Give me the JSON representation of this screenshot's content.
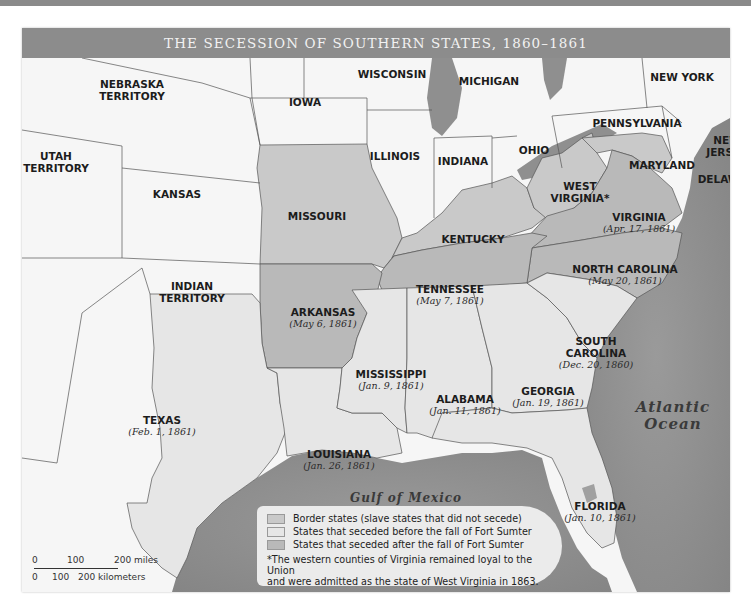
{
  "title": "THE SECESSION OF SOUTHERN STATES, 1860–1861",
  "colors": {
    "union": "#f7f7f7",
    "territory": "#fbfbfb",
    "border_states": "#c9c9c9",
    "seceded_before": "#e6e6e6",
    "seceded_after": "#b9b9b9",
    "water": "#8f8f8f",
    "title_bar": "#8c8c8c"
  },
  "regions": {
    "nebraska": {
      "name": "NEBRASKA",
      "name2": "TERRITORY"
    },
    "utah": {
      "name": "UTAH",
      "name2": "TERRITORY"
    },
    "kansas": {
      "name": "KANSAS"
    },
    "indian": {
      "name": "INDIAN",
      "name2": "TERRITORY"
    },
    "iowa": {
      "name": "IOWA"
    },
    "wisconsin": {
      "name": "WISCONSIN"
    },
    "michigan": {
      "name": "MICHIGAN"
    },
    "illinois": {
      "name": "ILLINOIS"
    },
    "indiana": {
      "name": "INDIANA"
    },
    "ohio": {
      "name": "OHIO"
    },
    "new_york": {
      "name": "NEW YORK"
    },
    "pennsylvania": {
      "name": "PENNSYLVANIA"
    },
    "new_jersey": {
      "name": "NEW",
      "name2": "JERSEY"
    },
    "maryland": {
      "name": "MARYLAND"
    },
    "delaware": {
      "name": "DELAWARE"
    },
    "missouri": {
      "name": "MISSOURI"
    },
    "kentucky": {
      "name": "KENTUCKY"
    },
    "west_virginia": {
      "name": "WEST",
      "name2": "VIRGINIA*"
    },
    "virginia": {
      "name": "VIRGINIA",
      "date": "(Apr. 17, 1861)"
    },
    "north_carolina": {
      "name": "NORTH CAROLINA",
      "date": "(May 20, 1861)"
    },
    "tennessee": {
      "name": "TENNESSEE",
      "date": "(May 7, 1861)"
    },
    "arkansas": {
      "name": "ARKANSAS",
      "date": "(May 6, 1861)"
    },
    "south_carolina": {
      "name": "SOUTH",
      "name2": "CAROLINA",
      "date": "(Dec. 20, 1860)"
    },
    "mississippi": {
      "name": "MISSISSIPPI",
      "date": "(Jan. 9, 1861)"
    },
    "alabama": {
      "name": "ALABAMA",
      "date": "(Jan. 11, 1861)"
    },
    "georgia": {
      "name": "GEORGIA",
      "date": "(Jan. 19, 1861)"
    },
    "texas": {
      "name": "TEXAS",
      "date": "(Feb. 1, 1861)"
    },
    "louisiana": {
      "name": "LOUISIANA",
      "date": "(Jan. 26, 1861)"
    },
    "florida": {
      "name": "FLORIDA",
      "date": "(Jan. 10, 1861)"
    }
  },
  "water": {
    "atlantic": {
      "line1": "Atlantic",
      "line2": "Ocean"
    },
    "gulf": "Gulf of Mexico"
  },
  "legend": {
    "items": [
      {
        "label": "Border states (slave states that did not secede)",
        "color": "#c9c9c9"
      },
      {
        "label": "States that seceded before the fall of Fort Sumter",
        "color": "#e6e6e6"
      },
      {
        "label": "States that seceded after the fall of Fort Sumter",
        "color": "#b9b9b9"
      }
    ],
    "footnote_line1": "*The western counties of Virginia remained loyal to the Union",
    "footnote_line2": "and were admitted as the state of West Virginia in 1863."
  },
  "scale": {
    "miles": [
      "0",
      "100",
      "200 miles"
    ],
    "kilometers": [
      "0",
      "100",
      "200 kilometers"
    ]
  }
}
